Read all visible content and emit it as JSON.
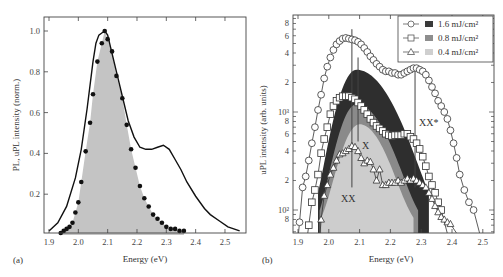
{
  "chart_data": [
    {
      "panel": "(a)",
      "type": "line",
      "title": "",
      "xlabel": "Energy (eV)",
      "ylabel": "PL, uPL intensity (norm.)",
      "xlim": [
        1.9,
        2.55
      ],
      "ylim": [
        0,
        1.05
      ],
      "xticks": [
        "1.9",
        "2.0",
        "2.1",
        "2.2",
        "2.3",
        "2.4",
        "2.5"
      ],
      "yticks": [
        "0.2",
        "0.4",
        "0.6",
        "0.8",
        "1.0"
      ],
      "grid": false,
      "series": [
        {
          "name": "PL (solid line)",
          "style": "line",
          "x": [
            1.9,
            1.93,
            1.96,
            1.99,
            2.01,
            2.03,
            2.05,
            2.06,
            2.07,
            2.08,
            2.09,
            2.1,
            2.11,
            2.13,
            2.15,
            2.17,
            2.19,
            2.21,
            2.23,
            2.25,
            2.27,
            2.29,
            2.31,
            2.33,
            2.35,
            2.37,
            2.4,
            2.43,
            2.45,
            2.48,
            2.51,
            2.55
          ],
          "y": [
            0.02,
            0.06,
            0.14,
            0.28,
            0.42,
            0.62,
            0.85,
            0.94,
            0.98,
            0.99,
            1.0,
            0.98,
            0.92,
            0.8,
            0.68,
            0.56,
            0.48,
            0.43,
            0.42,
            0.42,
            0.43,
            0.44,
            0.42,
            0.37,
            0.32,
            0.26,
            0.19,
            0.13,
            0.1,
            0.07,
            0.04,
            0.02
          ]
        },
        {
          "name": "uPL (dots)",
          "style": "scatter",
          "x": [
            1.94,
            1.95,
            1.96,
            1.97,
            1.98,
            1.99,
            2.0,
            2.01,
            2.025,
            2.04,
            2.05,
            2.065,
            2.08,
            2.09,
            2.1,
            2.115,
            2.13,
            2.15,
            2.165,
            2.18,
            2.195,
            2.21,
            2.225,
            2.24,
            2.255,
            2.27,
            2.285,
            2.3,
            2.315,
            2.33,
            2.345,
            2.36
          ],
          "y": [
            0.01,
            0.02,
            0.03,
            0.04,
            0.06,
            0.11,
            0.16,
            0.26,
            0.41,
            0.55,
            0.69,
            0.85,
            0.94,
            1.0,
            0.96,
            0.9,
            0.78,
            0.67,
            0.54,
            0.42,
            0.33,
            0.24,
            0.18,
            0.14,
            0.1,
            0.08,
            0.06,
            0.04,
            0.03,
            0.03,
            0.02,
            0.02
          ]
        },
        {
          "name": "uPL fill (gray area)",
          "style": "area",
          "color": "#c4c4c4"
        }
      ],
      "panel_label": "(a)"
    },
    {
      "panel": "(b)",
      "type": "scatter",
      "title": "",
      "xlabel": "Energy (eV)",
      "ylabel": "uPL intensity (arb. units)",
      "yscale": "log",
      "xlim": [
        1.885,
        2.565
      ],
      "ylim": [
        60,
        9500
      ],
      "xticks": [
        "1.9",
        "2.0",
        "2.1",
        "2.2",
        "2.3",
        "2.4",
        "2.5"
      ],
      "yticks": [
        "8",
        "10²",
        "2",
        "4",
        "6",
        "8",
        "10³",
        "2",
        "4",
        "6",
        "8"
      ],
      "grid": false,
      "legend_position": "upper right",
      "legend": [
        {
          "marker": "circle",
          "swatch": "#3a3a3a",
          "label": "1.6 mJ/cm²"
        },
        {
          "marker": "square",
          "swatch": "#8e8e8e",
          "label": "0.8 mJ/cm²"
        },
        {
          "marker": "triangle",
          "swatch": "#cfcfcf",
          "label": "0.4 mJ/cm²"
        }
      ],
      "series": [
        {
          "name": "1.6 mJ/cm² (circles)",
          "x": [
            1.905,
            1.915,
            1.925,
            1.935,
            1.945,
            1.955,
            1.965,
            1.975,
            1.985,
            1.995,
            2.005,
            2.015,
            2.025,
            2.035,
            2.045,
            2.055,
            2.065,
            2.075,
            2.085,
            2.095,
            2.105,
            2.115,
            2.125,
            2.135,
            2.145,
            2.155,
            2.165,
            2.175,
            2.185,
            2.195,
            2.205,
            2.215,
            2.225,
            2.235,
            2.245,
            2.255,
            2.265,
            2.275,
            2.285,
            2.295,
            2.305,
            2.315,
            2.325,
            2.335,
            2.345,
            2.355,
            2.365,
            2.375,
            2.385,
            2.395,
            2.405,
            2.415,
            2.425,
            2.44,
            2.455,
            2.47,
            2.485,
            2.5,
            2.51
          ],
          "y": [
            75,
            170,
            220,
            320,
            480,
            700,
            1050,
            1500,
            2200,
            2900,
            3600,
            4300,
            4900,
            5300,
            5600,
            5700,
            5600,
            5500,
            5400,
            5200,
            4900,
            4500,
            4100,
            3700,
            3400,
            3100,
            2900,
            2700,
            2600,
            2600,
            2500,
            2500,
            2400,
            2400,
            2500,
            2600,
            2700,
            2800,
            2800,
            2700,
            2600,
            2400,
            2100,
            1800,
            1550,
            1300,
            1150,
            1000,
            850,
            650,
            480,
            340,
            230,
            160,
            120,
            100,
            null,
            null,
            null
          ]
        },
        {
          "name": "0.8 mJ/cm² (squares)",
          "x": [
            1.935,
            1.945,
            1.955,
            1.965,
            1.975,
            1.985,
            1.995,
            2.005,
            2.015,
            2.025,
            2.035,
            2.045,
            2.055,
            2.065,
            2.075,
            2.085,
            2.095,
            2.105,
            2.115,
            2.125,
            2.135,
            2.145,
            2.155,
            2.165,
            2.175,
            2.185,
            2.195,
            2.205,
            2.215,
            2.225,
            2.235,
            2.245,
            2.255,
            2.265,
            2.275,
            2.285,
            2.295,
            2.305,
            2.315,
            2.325,
            2.335,
            2.345,
            2.355,
            2.365,
            2.375,
            2.385,
            2.395,
            2.405,
            2.415
          ],
          "y": [
            70,
            120,
            160,
            230,
            380,
            530,
            700,
            950,
            1150,
            1300,
            1400,
            1450,
            1450,
            1450,
            1400,
            1350,
            1250,
            1150,
            1050,
            950,
            850,
            780,
            720,
            680,
            640,
            600,
            580,
            570,
            580,
            580,
            580,
            600,
            600,
            560,
            530,
            480,
            420,
            350,
            280,
            220,
            180,
            150,
            120,
            100,
            null,
            null,
            null,
            null,
            null
          ]
        },
        {
          "name": "0.4 mJ/cm² (triangles)",
          "x": [
            1.975,
            1.985,
            1.995,
            2.005,
            2.015,
            2.025,
            2.035,
            2.045,
            2.055,
            2.065,
            2.075,
            2.085,
            2.095,
            2.105,
            2.115,
            2.125,
            2.135,
            2.145,
            2.155,
            2.165,
            2.175,
            2.185,
            2.195,
            2.205,
            2.215,
            2.225,
            2.235,
            2.245,
            2.255,
            2.265,
            2.275,
            2.285,
            2.295,
            2.305,
            2.315,
            2.325,
            2.335,
            2.345,
            2.355,
            2.365,
            2.375,
            2.385,
            2.395
          ],
          "y": [
            80,
            140,
            180,
            230,
            270,
            320,
            370,
            380,
            400,
            420,
            450,
            440,
            400,
            340,
            300,
            320,
            310,
            260,
            200,
            260,
            180,
            180,
            190,
            190,
            190,
            200,
            190,
            200,
            210,
            200,
            210,
            200,
            190,
            180,
            170,
            150,
            130,
            110,
            95,
            85,
            80,
            75,
            72
          ]
        }
      ],
      "filled_areas": [
        {
          "name": "1.6 mJ/cm² fill",
          "color": "#2e2e2e",
          "peak_x": 2.09,
          "peak_y": 2700,
          "range": [
            1.965,
            2.325
          ]
        },
        {
          "name": "0.8 mJ/cm² fill",
          "color": "#8a8a8a",
          "peak_x": 2.09,
          "peak_y": 1200,
          "range": [
            1.97,
            2.29
          ]
        },
        {
          "name": "0.4 mJ/cm² fill",
          "color": "#cdcdcd",
          "peak_x": 2.1,
          "peak_y": 750,
          "range": [
            1.975,
            2.275
          ]
        }
      ],
      "vertical_lines": [
        {
          "x": 2.075,
          "y_from": 170,
          "y_to": 7000
        },
        {
          "x": 2.095,
          "y_from": 500,
          "y_to": 3600
        },
        {
          "x": 2.28,
          "y_from": 170,
          "y_to": 2700
        }
      ],
      "annotations": [
        {
          "text": "X",
          "x": 2.12,
          "y": 420
        },
        {
          "text": "XX",
          "x": 2.075,
          "y": 135
        },
        {
          "text": "XX*",
          "x": 2.36,
          "y": 700
        }
      ],
      "panel_label": "(b)"
    }
  ],
  "labels": {
    "panel_a": "(a)",
    "panel_b": "(b)",
    "xlabel_a": "Energy (eV)",
    "xlabel_b": "Energy (eV)",
    "ylabel_a": "PL, uPL intensity (norm.)",
    "ylabel_b": "uPL intensity (arb. units)",
    "ann_x": "X",
    "ann_xx": "XX",
    "ann_xxstar": "XX*",
    "legend": [
      "1.6 mJ/cm²",
      "0.8 mJ/cm²",
      "0.4 mJ/cm²"
    ]
  }
}
